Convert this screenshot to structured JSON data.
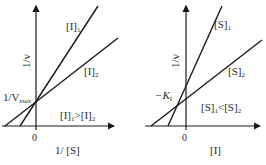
{
  "panels": [
    {
      "id": "competitive",
      "y_axis_label": "1/v",
      "x_axis_label": "1/ [S]",
      "origin_label": "0",
      "intercept_label_main": "1/V",
      "intercept_label_sub": "max",
      "lines": [
        {
          "label": "[I]",
          "sub": "1"
        },
        {
          "label": "[I]",
          "sub": "2"
        }
      ],
      "relation": {
        "a": "[I]",
        "a_sub": "1",
        "op": ">",
        "b": "[I]",
        "b_sub": "2"
      }
    },
    {
      "id": "dixon",
      "y_axis_label": "1/v",
      "x_axis_label": "[I]",
      "origin_label": "0",
      "intercept_label_main": "−K",
      "intercept_label_sub": "I",
      "lines": [
        {
          "label": "[S]",
          "sub": "1"
        },
        {
          "label": "[S]",
          "sub": "2"
        }
      ],
      "relation": {
        "a": "[S]",
        "a_sub": "1",
        "op": "<",
        "b": "[S]",
        "b_sub": "2"
      }
    }
  ],
  "colors": {
    "line": "#1a1a1a",
    "text": "#2a2a2a",
    "background": "#ffffff"
  }
}
